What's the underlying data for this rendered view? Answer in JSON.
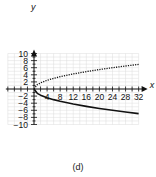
{
  "caption": "(d)",
  "chart_data": {
    "type": "line",
    "title": "",
    "subtitle": "(d)",
    "xlabel": "x",
    "ylabel": "y",
    "xlim": [
      -8,
      32
    ],
    "ylim": [
      -10,
      10
    ],
    "grid": true,
    "x_ticks": [
      4,
      8,
      12,
      16,
      20,
      24,
      28,
      32
    ],
    "y_ticks": [
      -10,
      -8,
      -6,
      -4,
      -2,
      2,
      4,
      6,
      8,
      10
    ],
    "x": [
      0,
      1,
      2,
      4,
      6,
      8,
      12,
      16,
      20,
      24,
      28,
      32
    ],
    "series": [
      {
        "name": "upper branch (dotted)",
        "style": "dotted",
        "values": [
          0,
          1.22,
          1.73,
          2.45,
          3.0,
          3.46,
          4.24,
          4.9,
          5.48,
          6.0,
          6.48,
          6.93
        ]
      },
      {
        "name": "lower branch (solid)",
        "style": "solid",
        "values": [
          0,
          -1.22,
          -1.73,
          -2.45,
          -3.0,
          -3.46,
          -4.24,
          -4.9,
          -5.48,
          -6.0,
          -6.48,
          -6.93
        ]
      }
    ],
    "colors": {
      "axis": "#111111",
      "grid": "#dddddd",
      "curve": "#111111"
    }
  }
}
